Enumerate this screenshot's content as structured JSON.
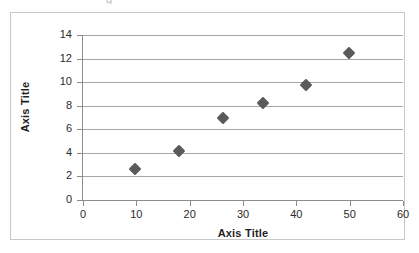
{
  "page": {
    "top_remnant_glyph": "g"
  },
  "chart_data": {
    "type": "scatter",
    "title": "",
    "xlabel": "Axis Title",
    "ylabel": "Axis Title",
    "xlim": [
      0,
      60
    ],
    "ylim": [
      0,
      14
    ],
    "xticks": [
      0,
      10,
      20,
      30,
      40,
      50,
      60
    ],
    "yticks": [
      0,
      2,
      4,
      6,
      8,
      10,
      12,
      14
    ],
    "xtick_labels": [
      "0",
      "10",
      "20",
      "30",
      "40",
      "50",
      "60"
    ],
    "ytick_labels": [
      "0",
      "2",
      "4",
      "6",
      "8",
      "10",
      "12",
      "14"
    ],
    "grid": "horizontal",
    "legend": "none",
    "marker_shape": "diamond",
    "marker_color": "#5a5a5a",
    "gridline_color": "#a6a6a6",
    "axis_color": "#8c8c8c",
    "border_color": "#c8c8c8",
    "series": [
      {
        "name": "Series 1",
        "points": [
          {
            "x": 9.8,
            "y": 2.6
          },
          {
            "x": 18.0,
            "y": 4.2
          },
          {
            "x": 26.3,
            "y": 7.0
          },
          {
            "x": 33.8,
            "y": 8.2
          },
          {
            "x": 41.8,
            "y": 9.8
          },
          {
            "x": 49.9,
            "y": 12.5
          }
        ]
      }
    ]
  }
}
